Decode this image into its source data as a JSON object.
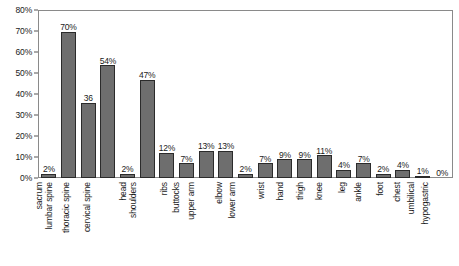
{
  "chart_data": {
    "type": "bar",
    "title": "",
    "subtitle": "",
    "xlabel": "",
    "ylabel": "",
    "ylim": [
      0,
      80
    ],
    "grid": false,
    "legend": "none",
    "y_ticks": [
      "0%",
      "10%",
      "20%",
      "30%",
      "40%",
      "50%",
      "60%",
      "70%",
      "80%"
    ],
    "y_tick_values": [
      0,
      10,
      20,
      30,
      40,
      50,
      60,
      70,
      80
    ],
    "categories": [
      "sacrum",
      "lumbar spine",
      "thoracic spine",
      "cervical spine",
      "head",
      "shoulders",
      "ribs",
      "buttocks",
      "upper arm",
      "elbow",
      "lower arm",
      "wrist",
      "hand",
      "thigh",
      "knee",
      "leg",
      "ankle",
      "foot",
      "chest",
      "umbilical",
      "hypogastric"
    ],
    "values": [
      2,
      70,
      36,
      54,
      2,
      47,
      12,
      7,
      13,
      13,
      2,
      7,
      9,
      9,
      11,
      4,
      7,
      2,
      4,
      1,
      0
    ],
    "data_labels": [
      "2%",
      "70%",
      "36",
      "54%",
      "2%",
      "47%",
      "12%",
      "7%",
      "13%",
      "13%",
      "2%",
      "7%",
      "9%",
      "9%",
      "11%",
      "4%",
      "7%",
      "2%",
      "4%",
      "1%",
      "0%"
    ],
    "bar_fill_color": "#6e6e6e",
    "bar_edge_color": "#2b2b2b",
    "axis_color": "#8a8a8a",
    "background_color": "#ffffff"
  }
}
